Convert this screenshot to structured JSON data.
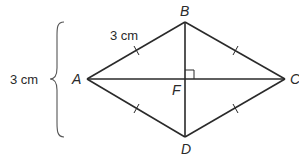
{
  "diagram": {
    "type": "rhombus",
    "vertices": {
      "A": {
        "label": "A",
        "x": 87,
        "y": 79
      },
      "B": {
        "label": "B",
        "x": 185,
        "y": 22
      },
      "C": {
        "label": "C",
        "x": 285,
        "y": 79
      },
      "D": {
        "label": "D",
        "x": 185,
        "y": 137
      },
      "F": {
        "label": "F",
        "x": 185,
        "y": 79
      }
    },
    "labels": {
      "A": "A",
      "B": "B",
      "C": "C",
      "D": "D",
      "F": "F"
    },
    "measurements": {
      "side_AB": "3 cm",
      "diagonal_BD": "3 cm"
    },
    "annotations": {
      "right_angle_at": "F",
      "congruent_tick_marks": [
        "AB",
        "BC",
        "CD",
        "DA"
      ],
      "brace": "vertical brace spanning B to D height"
    },
    "colors": {
      "line": "#2a2a2a",
      "brace": "#555555",
      "background": "#ffffff"
    }
  }
}
